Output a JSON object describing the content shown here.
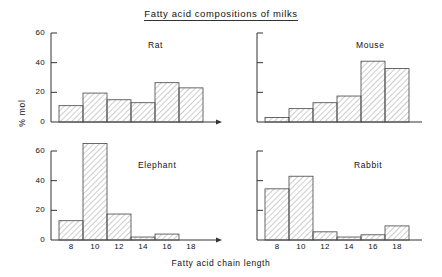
{
  "figure": {
    "title": "Fatty acid compositions of milks",
    "xlabel": "Fatty acid chain length",
    "ylabel": "% mol",
    "background": "#ffffff",
    "line_color": "#333333",
    "hatch_color": "#8a8a8a"
  },
  "chart_data": {
    "type": "bar",
    "title": "Fatty acid compositions of milks",
    "xlabel": "Fatty acid chain length",
    "ylabel": "% mol",
    "categories": [
      "8",
      "10",
      "12",
      "14",
      "16",
      "18"
    ],
    "ylim": [
      0,
      60
    ],
    "yticks": [
      0,
      20,
      40,
      60
    ],
    "grid": false,
    "legend": "none",
    "panel_layout": "2x2",
    "series": [
      {
        "name": "Rat",
        "values": [
          11,
          19.5,
          15,
          13,
          26.5,
          23
        ],
        "yticks_labelled": true
      },
      {
        "name": "Mouse",
        "values": [
          3,
          9,
          13,
          17.5,
          41,
          36
        ],
        "yticks_labelled": false
      },
      {
        "name": "Elephant",
        "values": [
          13,
          65,
          17.5,
          2,
          4,
          0
        ],
        "yticks_labelled": true
      },
      {
        "name": "Rabbit",
        "values": [
          34.5,
          43,
          5.5,
          2,
          3.5,
          9.5
        ],
        "yticks_labelled": false
      }
    ]
  },
  "panels": {
    "rat": {
      "label": "Rat",
      "ytick_labels": [
        "60",
        "40",
        "20",
        "0"
      ],
      "xtick_labels": [
        "8",
        "10",
        "12",
        "14",
        "16",
        "18"
      ]
    },
    "mouse": {
      "label": "Mouse",
      "ytick_labels": [],
      "xtick_labels": []
    },
    "elephant": {
      "label": "Elephant",
      "ytick_labels": [
        "60",
        "40",
        "20",
        "0"
      ],
      "xtick_labels": [
        "8",
        "10",
        "12",
        "14",
        "16",
        "18"
      ]
    },
    "rabbit": {
      "label": "Rabbit",
      "ytick_labels": [],
      "xtick_labels": [
        "8",
        "10",
        "12",
        "14",
        "16",
        "18"
      ]
    }
  }
}
